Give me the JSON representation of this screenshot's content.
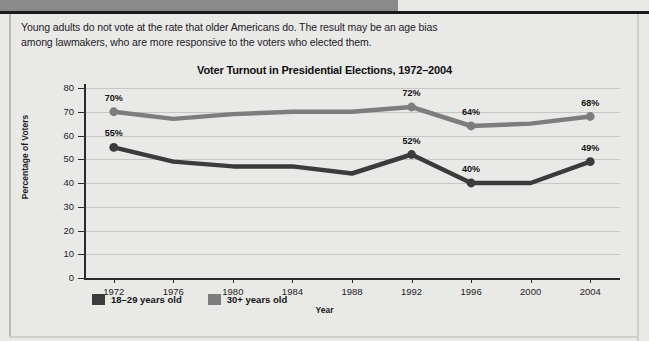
{
  "intro": {
    "text": "Young adults do not vote at the rate that older Americans do. The result may be an age bias among lawmakers, who are more responsive to the voters who elected them."
  },
  "colors": {
    "young_series": "#3b3b3b",
    "older_series": "#7d7d7d",
    "page_background": "#e9e9e7",
    "axis": "#2a2a2a",
    "gridline": "#c6c6c4"
  },
  "chart_data": {
    "type": "line",
    "title": "Voter Turnout in Presidential Elections, 1972–2004",
    "xlabel": "Year",
    "ylabel": "Percentage of Voters",
    "ylim": [
      0,
      80
    ],
    "yticks": [
      0,
      10,
      20,
      30,
      40,
      50,
      60,
      70,
      80
    ],
    "grid": true,
    "legend_position": "inside-bottom-left",
    "categories": [
      "1972",
      "1976",
      "1980",
      "1984",
      "1988",
      "1992",
      "1996",
      "2000",
      "2004"
    ],
    "series": [
      {
        "name": "30+ years old",
        "color": "#7d7d7d",
        "values": [
          70,
          67,
          69,
          70,
          70,
          72,
          64,
          65,
          68
        ],
        "labels": [
          {
            "index": 0,
            "text": "70%"
          },
          {
            "index": 5,
            "text": "72%"
          },
          {
            "index": 6,
            "text": "64%"
          },
          {
            "index": 8,
            "text": "68%"
          }
        ]
      },
      {
        "name": "18–29 years old",
        "color": "#3b3b3b",
        "values": [
          55,
          49,
          47,
          47,
          44,
          52,
          40,
          40,
          49
        ],
        "labels": [
          {
            "index": 0,
            "text": "55%"
          },
          {
            "index": 5,
            "text": "52%"
          },
          {
            "index": 6,
            "text": "40%"
          },
          {
            "index": 8,
            "text": "49%"
          }
        ]
      }
    ]
  },
  "legend": [
    {
      "label": "18–29 years old",
      "color": "#3b3b3b"
    },
    {
      "label": "30+ years old",
      "color": "#7d7d7d"
    }
  ]
}
